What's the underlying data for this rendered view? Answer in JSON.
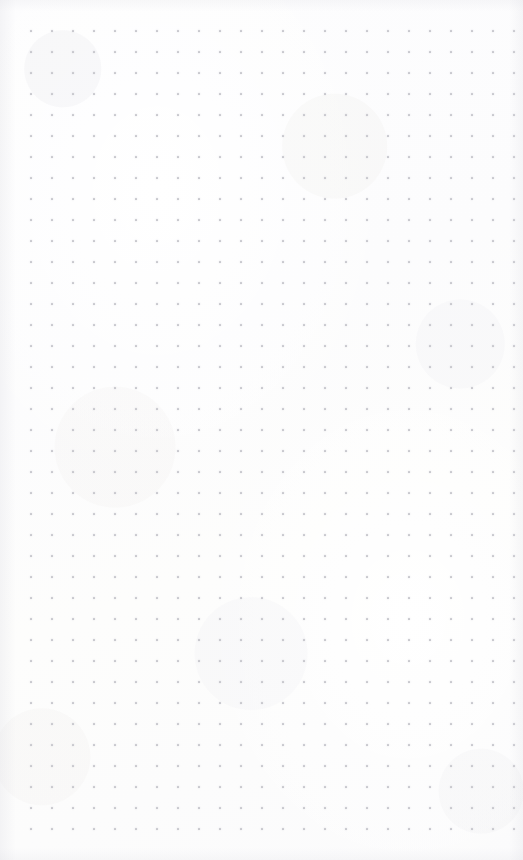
{
  "document": {
    "type": "dot-grid-notebook-page",
    "title": "Blank dot grid page",
    "content_text": "",
    "has_handwriting": false,
    "has_printed_text": false
  },
  "page": {
    "width": 523,
    "height": 860,
    "background_color": "#fdfdfd",
    "paper_tone": "near-white scanned paper"
  },
  "grid": {
    "dot_color": "#c6c6cc",
    "dot_size_px": 1.7,
    "spacing_px": 21,
    "origin_x": 31,
    "origin_y": 31,
    "columns": 24,
    "rows": 39,
    "margin_left_px": 31,
    "margin_top_px": 31,
    "margin_right_px": 9,
    "margin_bottom_px": 33
  }
}
